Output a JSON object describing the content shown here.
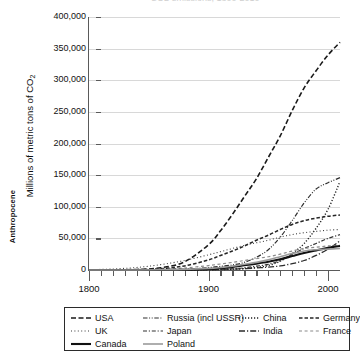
{
  "chart_data": {
    "type": "line",
    "title": "CO2 emissions, 1800-2010",
    "xlabel": "",
    "ylabel": "Millions of metric tons of CO2",
    "xlim": [
      1800,
      2010
    ],
    "ylim": [
      0,
      400000
    ],
    "xticks": [
      "1800",
      "1900",
      "2000"
    ],
    "yticks": [
      "0",
      "50,000",
      "100,000",
      "150,000",
      "200,000",
      "250,000",
      "300,000",
      "350,000",
      "400,000"
    ],
    "grid": true,
    "legend_position": "bottom",
    "annotation": "Anthropocene",
    "x": [
      1800,
      1820,
      1840,
      1860,
      1880,
      1900,
      1910,
      1920,
      1930,
      1940,
      1950,
      1960,
      1970,
      1980,
      1990,
      2000,
      2010
    ],
    "series": [
      {
        "name": "USA",
        "style": "dashed",
        "color": "#1a1a1a",
        "width": 1.6,
        "values": [
          0,
          200,
          900,
          3500,
          13000,
          40000,
          62000,
          88000,
          116000,
          144000,
          178000,
          212000,
          252000,
          288000,
          315000,
          340000,
          360000
        ]
      },
      {
        "name": "Russia (incl USSR)",
        "style": "dash-dot-dot",
        "color": "#2e2e2e",
        "width": 1.2,
        "values": [
          0,
          0,
          100,
          400,
          1200,
          3800,
          5800,
          8000,
          12000,
          20000,
          32000,
          52000,
          78000,
          106000,
          128000,
          138000,
          146000
        ]
      },
      {
        "name": "China",
        "style": "dotted",
        "color": "#1f1f1f",
        "width": 1.4,
        "values": [
          0,
          0,
          0,
          0,
          100,
          400,
          700,
          1200,
          2200,
          4000,
          7000,
          14000,
          26000,
          42000,
          66000,
          96000,
          140000
        ]
      },
      {
        "name": "Germany",
        "style": "dashed-short",
        "color": "#262626",
        "width": 1.5,
        "values": [
          0,
          100,
          500,
          2000,
          6500,
          16000,
          23000,
          30000,
          38000,
          47000,
          55000,
          64000,
          72000,
          78000,
          82000,
          85000,
          87000
        ]
      },
      {
        "name": "UK",
        "style": "dotted-fine",
        "color": "#3a3a3a",
        "width": 1.1,
        "values": [
          500,
          1600,
          4000,
          8500,
          15000,
          24000,
          29000,
          34000,
          39000,
          43000,
          47000,
          52000,
          56000,
          59000,
          61000,
          63000,
          64000
        ]
      },
      {
        "name": "Japan",
        "style": "dash-dot",
        "color": "#333333",
        "width": 1.2,
        "values": [
          0,
          0,
          0,
          0,
          100,
          500,
          1000,
          2000,
          3500,
          6000,
          9000,
          15000,
          25000,
          34000,
          42000,
          50000,
          56000
        ]
      },
      {
        "name": "India",
        "style": "dash-dot-long",
        "color": "#2b2b2b",
        "width": 1.3,
        "values": [
          0,
          0,
          0,
          0,
          100,
          400,
          800,
          1400,
          2200,
          3200,
          4500,
          6500,
          10000,
          15000,
          23000,
          33000,
          46000
        ]
      },
      {
        "name": "France",
        "style": "dash-light",
        "color": "#8a8a8a",
        "width": 1.2,
        "values": [
          0,
          100,
          300,
          1200,
          3200,
          7000,
          9500,
          12000,
          15000,
          18000,
          21000,
          25000,
          30000,
          34000,
          36000,
          38000,
          39000
        ]
      },
      {
        "name": "Canada",
        "style": "solid-bold",
        "color": "#111111",
        "width": 2.1,
        "values": [
          0,
          0,
          0,
          100,
          400,
          1500,
          3000,
          5000,
          7500,
          10000,
          13000,
          17000,
          22000,
          27000,
          31000,
          35000,
          38000
        ]
      },
      {
        "name": "Poland",
        "style": "solid-light",
        "color": "#9a9a9a",
        "width": 1.6,
        "values": [
          0,
          0,
          50,
          300,
          900,
          2500,
          4000,
          6000,
          9000,
          12000,
          16000,
          21000,
          26000,
          30000,
          32000,
          33000,
          34000
        ]
      }
    ]
  },
  "legend": {
    "rows": [
      [
        {
          "label": "USA",
          "style": "dashed"
        },
        {
          "label": "Russia (incl USSR)",
          "style": "dash-dot-dot"
        },
        {
          "label": "China",
          "style": "dotted"
        },
        {
          "label": "Germany",
          "style": "dashed-short"
        }
      ],
      [
        {
          "label": "UK",
          "style": "dotted-fine"
        },
        {
          "label": "Japan",
          "style": "dash-dot"
        },
        {
          "label": "India",
          "style": "dash-dot-long"
        },
        {
          "label": "France",
          "style": "dash-light"
        }
      ],
      [
        {
          "label": "Canada",
          "style": "solid-bold"
        },
        {
          "label": "Poland",
          "style": "solid-light"
        }
      ]
    ]
  }
}
